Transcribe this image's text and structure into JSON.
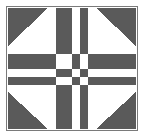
{
  "figure": {
    "canvas": {
      "width": 146,
      "height": 138
    },
    "colors": {
      "background": "#ffffff",
      "patch_light": "#ffffff",
      "patch_dark": "#5a5a5a",
      "frame": "#7a7a7a",
      "frame_width": 1.5
    },
    "frame": {
      "x": 6.5,
      "y": 6.5,
      "width": 131,
      "height": 124
    }
  },
  "block": {
    "name": "checkerboard-cross-quilt-block",
    "inner": {
      "x": 8,
      "y": 8,
      "width": 128,
      "height": 121
    },
    "grid": {
      "x_stops": [
        8,
        48,
        56,
        72,
        80,
        88,
        96,
        136
      ],
      "y_stops": [
        8,
        46,
        54,
        69,
        77,
        85,
        92,
        129
      ],
      "columns": 5,
      "rows": 5
    },
    "corner_triangles": [
      {
        "name": "triangle-top-left",
        "fill": "#5a5a5a",
        "points": "8,8 48,8 8,46",
        "orientation": "points-down-left",
        "hypotenuse": "top-right-to-bottom-left"
      },
      {
        "name": "triangle-top-right",
        "fill": "#5a5a5a",
        "points": "96,8 136,8 136,46",
        "orientation": "points-down-right",
        "hypotenuse": "top-left-to-bottom-right"
      },
      {
        "name": "triangle-bottom-left",
        "fill": "#5a5a5a",
        "points": "8,92 8,129 48,129",
        "orientation": "points-up-left",
        "hypotenuse": "bottom-right-to-top-left"
      },
      {
        "name": "triangle-bottom-right",
        "fill": "#5a5a5a",
        "points": "136,92 136,129 96,129",
        "orientation": "points-up-right",
        "hypotenuse": "bottom-left-to-top-right"
      }
    ],
    "vertical_bars": [
      {
        "name": "bar-top-left-white",
        "fill": "#ffffff",
        "x": 48,
        "y": 8,
        "width": 8,
        "height": 38
      },
      {
        "name": "bar-top-center-dark",
        "fill": "#5a5a5a",
        "x": 56,
        "y": 8,
        "width": 16,
        "height": 38
      },
      {
        "name": "bar-top-right-white",
        "fill": "#ffffff",
        "x": 72,
        "y": 8,
        "width": 8,
        "height": 38
      },
      {
        "name": "bar-top-far-dark",
        "fill": "#5a5a5a",
        "x": 80,
        "y": 8,
        "width": 8,
        "height": 38
      },
      {
        "name": "bar-top-far-white",
        "fill": "#ffffff",
        "x": 88,
        "y": 8,
        "width": 8,
        "height": 38
      },
      {
        "name": "bar-bottom-left-white",
        "fill": "#ffffff",
        "x": 48,
        "y": 92,
        "width": 8,
        "height": 37
      },
      {
        "name": "bar-bottom-center-dark",
        "fill": "#5a5a5a",
        "x": 56,
        "y": 92,
        "width": 16,
        "height": 37
      },
      {
        "name": "bar-bottom-right-white",
        "fill": "#ffffff",
        "x": 72,
        "y": 92,
        "width": 8,
        "height": 37
      },
      {
        "name": "bar-bottom-far-dark",
        "fill": "#5a5a5a",
        "x": 80,
        "y": 92,
        "width": 8,
        "height": 37
      },
      {
        "name": "bar-bottom-far-white",
        "fill": "#ffffff",
        "x": 88,
        "y": 92,
        "width": 8,
        "height": 37
      }
    ],
    "horizontal_bars": [
      {
        "name": "bar-left-top-white",
        "fill": "#ffffff",
        "x": 8,
        "y": 46,
        "width": 40,
        "height": 8
      },
      {
        "name": "bar-left-mid-dark",
        "fill": "#5a5a5a",
        "x": 8,
        "y": 54,
        "width": 40,
        "height": 15
      },
      {
        "name": "bar-left-mid-white",
        "fill": "#ffffff",
        "x": 8,
        "y": 69,
        "width": 40,
        "height": 8
      },
      {
        "name": "bar-left-low-dark",
        "fill": "#5a5a5a",
        "x": 8,
        "y": 77,
        "width": 40,
        "height": 8
      },
      {
        "name": "bar-left-low-white",
        "fill": "#ffffff",
        "x": 8,
        "y": 85,
        "width": 40,
        "height": 7
      },
      {
        "name": "bar-right-top-white",
        "fill": "#ffffff",
        "x": 96,
        "y": 46,
        "width": 40,
        "height": 8
      },
      {
        "name": "bar-right-mid-dark",
        "fill": "#5a5a5a",
        "x": 96,
        "y": 54,
        "width": 40,
        "height": 15
      },
      {
        "name": "bar-right-mid-white",
        "fill": "#ffffff",
        "x": 96,
        "y": 69,
        "width": 40,
        "height": 8
      },
      {
        "name": "bar-right-low-dark",
        "fill": "#5a5a5a",
        "x": 96,
        "y": 77,
        "width": 40,
        "height": 8
      },
      {
        "name": "bar-right-low-white",
        "fill": "#ffffff",
        "x": 96,
        "y": 85,
        "width": 40,
        "height": 7
      }
    ],
    "center_checkerboard": {
      "name": "center-checkerboard",
      "origin": {
        "x": 48,
        "y": 46
      },
      "col_x": [
        48,
        56,
        72,
        80,
        88
      ],
      "col_w": [
        8,
        16,
        8,
        8,
        8
      ],
      "row_y": [
        46,
        54,
        69,
        77,
        85
      ],
      "row_h": [
        8,
        15,
        8,
        8,
        7
      ],
      "cells": [
        [
          "#ffffff",
          "#5a5a5a",
          "#ffffff",
          "#5a5a5a",
          "#ffffff"
        ],
        [
          "#5a5a5a",
          "#ffffff",
          "#5a5a5a",
          "#ffffff",
          "#5a5a5a"
        ],
        [
          "#ffffff",
          "#5a5a5a",
          "#ffffff",
          "#5a5a5a",
          "#ffffff"
        ],
        [
          "#5a5a5a",
          "#ffffff",
          "#5a5a5a",
          "#ffffff",
          "#5a5a5a"
        ],
        [
          "#ffffff",
          "#5a5a5a",
          "#ffffff",
          "#5a5a5a",
          "#ffffff"
        ]
      ]
    }
  }
}
